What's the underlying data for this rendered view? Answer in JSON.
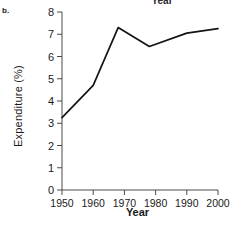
{
  "panel": {
    "label": "b."
  },
  "cropped_title": {
    "text": "Year"
  },
  "chart_data": {
    "type": "line",
    "title": "",
    "xlabel": "Year",
    "ylabel": "Expenditure (%)",
    "xlim": [
      1950,
      2000
    ],
    "ylim": [
      0,
      8
    ],
    "xticks": [
      1950,
      1960,
      1970,
      1980,
      1990,
      2000
    ],
    "xtick_labels": [
      "1950",
      "1960",
      "1970",
      "1980",
      "1990",
      "2000"
    ],
    "yticks": [
      0,
      1,
      2,
      3,
      4,
      5,
      6,
      7,
      8
    ],
    "ytick_labels": [
      "0",
      "1",
      "2",
      "3",
      "4",
      "5",
      "6",
      "7",
      "8"
    ],
    "grid": false,
    "legend": null,
    "series": [
      {
        "name": "Expenditure",
        "color": "#141414",
        "x": [
          1950,
          1960,
          1968,
          1978,
          1990,
          2000
        ],
        "values": [
          3.25,
          4.7,
          7.3,
          6.45,
          7.05,
          7.25
        ]
      }
    ]
  }
}
